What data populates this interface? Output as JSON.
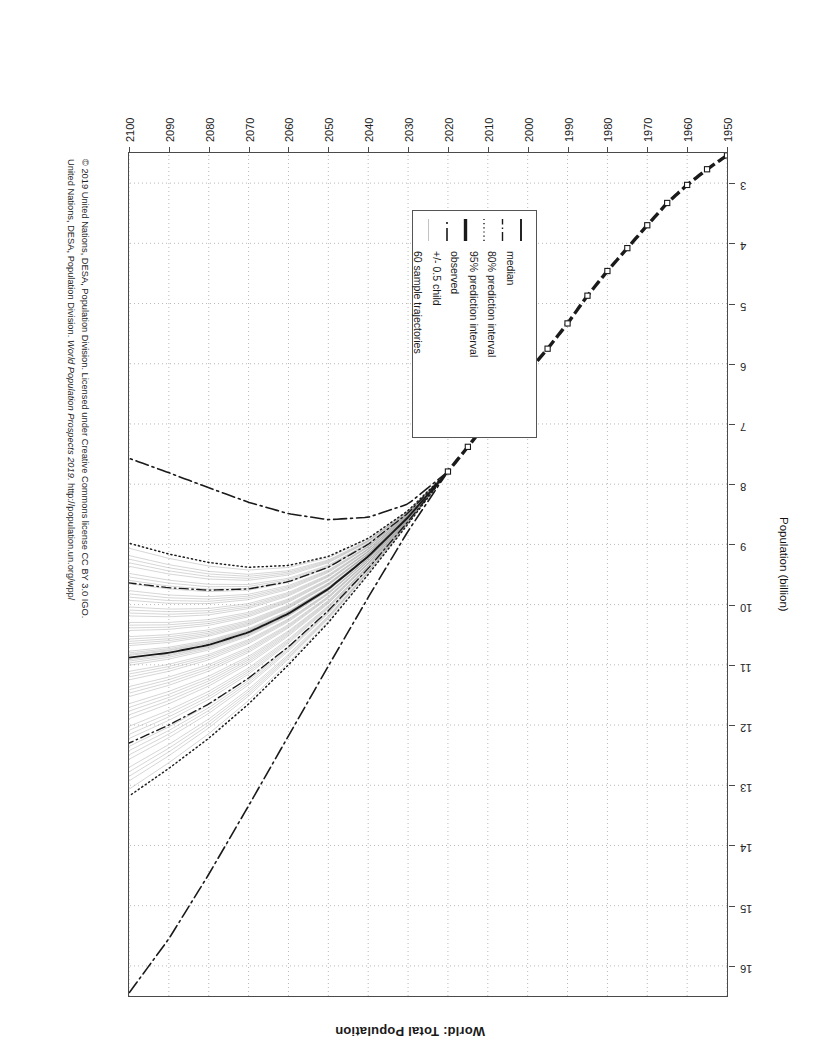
{
  "chart_data": {
    "type": "line",
    "title": "World: Total Population",
    "xlabel": "",
    "ylabel": "Population (billion)",
    "xlim": [
      1950,
      2100
    ],
    "ylim": [
      2.5,
      16.5
    ],
    "grid": true,
    "x_ticks": [
      1950,
      1960,
      1970,
      1980,
      1990,
      2000,
      2010,
      2020,
      2030,
      2040,
      2050,
      2060,
      2070,
      2080,
      2090,
      2100
    ],
    "y_ticks": [
      3,
      4,
      5,
      6,
      7,
      8,
      9,
      10,
      11,
      12,
      13,
      14,
      15,
      16
    ],
    "legend_position": "inside-lower-left",
    "series": [
      {
        "name": "observed",
        "style": "solid-thick",
        "x": [
          1950,
          1955,
          1960,
          1965,
          1970,
          1975,
          1980,
          1985,
          1990,
          1995,
          2000,
          2005,
          2010,
          2015,
          2020
        ],
        "values": [
          2.54,
          2.77,
          3.03,
          3.33,
          3.7,
          4.08,
          4.46,
          4.87,
          5.33,
          5.75,
          6.14,
          6.54,
          6.96,
          7.38,
          7.79
        ]
      },
      {
        "name": "median",
        "style": "solid",
        "x": [
          2020,
          2030,
          2040,
          2050,
          2060,
          2070,
          2080,
          2090,
          2100
        ],
        "values": [
          7.79,
          8.55,
          9.2,
          9.74,
          10.15,
          10.46,
          10.67,
          10.8,
          10.88
        ]
      },
      {
        "name": "80% prediction interval",
        "style": "dashdot",
        "bounds": {
          "x": [
            2020,
            2030,
            2040,
            2050,
            2060,
            2070,
            2080,
            2090,
            2100
          ],
          "lower": [
            7.79,
            8.48,
            9.0,
            9.38,
            9.62,
            9.74,
            9.76,
            9.72,
            9.64
          ],
          "upper": [
            7.79,
            8.62,
            9.4,
            10.1,
            10.7,
            11.22,
            11.65,
            12.0,
            12.3
          ]
        }
      },
      {
        "name": "95% prediction interval",
        "style": "dotted",
        "bounds": {
          "x": [
            2020,
            2030,
            2040,
            2050,
            2060,
            2070,
            2080,
            2090,
            2100
          ],
          "lower": [
            7.79,
            8.44,
            8.9,
            9.2,
            9.35,
            9.38,
            9.3,
            9.16,
            8.98
          ],
          "upper": [
            7.79,
            8.66,
            9.5,
            10.3,
            11.0,
            11.65,
            12.22,
            12.72,
            13.18
          ]
        }
      },
      {
        "name": "+/- 0.5 child",
        "style": "dashdot-long",
        "bounds": {
          "x": [
            2020,
            2030,
            2040,
            2050,
            2060,
            2070,
            2080,
            2090,
            2100
          ],
          "lower": [
            7.79,
            8.33,
            8.55,
            8.59,
            8.49,
            8.3,
            8.06,
            7.81,
            7.57
          ],
          "upper": [
            7.79,
            8.78,
            9.88,
            11.02,
            12.18,
            13.34,
            14.48,
            15.55,
            16.45
          ]
        }
      },
      {
        "name": "60 sample trajectories",
        "style": "thin-gray",
        "count": 60
      }
    ]
  },
  "legend": {
    "items": [
      {
        "label": "median",
        "key": "solid-line"
      },
      {
        "label": "80% prediction interval",
        "key": "dashdot-line"
      },
      {
        "label": "95% prediction interval",
        "key": "dotted-line"
      },
      {
        "label": "observed",
        "key": "thick-solid-line"
      },
      {
        "label": "+/- 0.5 child",
        "key": "dashdot-long-line"
      },
      {
        "label": "60 sample trajectories",
        "key": "thin-gray-line"
      }
    ]
  },
  "credit": {
    "line1": "© 2019 United Nations, DESA, Population Division. Licensed under Creative Commons license CC BY 3.0 IGO.",
    "line2_prefix": "United Nations, DESA, Population Division. ",
    "line2_italic": "World Population Prospects 2019",
    "line2_suffix": ". http://population.un.org/wpp/"
  },
  "colors": {
    "axis": "#4a4a4a",
    "grid": "#b9b9b9",
    "ink": "#1a1a1a",
    "trajectory": "#9a9a9a"
  }
}
